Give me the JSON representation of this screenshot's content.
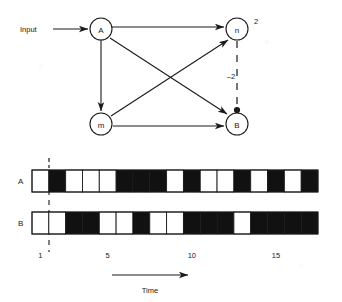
{
  "figure": {
    "background": "#ffffff",
    "ink": "#1a1a1a",
    "fill_black": "#111111"
  },
  "network": {
    "input_label": "Input",
    "nodes": [
      {
        "id": "A",
        "label": "A",
        "cx": 101,
        "cy": 29,
        "r": 11
      },
      {
        "id": "n",
        "label": "n",
        "cx": 237,
        "cy": 29,
        "r": 11
      },
      {
        "id": "m",
        "label": "m",
        "cx": 101,
        "cy": 124,
        "r": 11
      },
      {
        "id": "B",
        "label": "B",
        "cx": 237,
        "cy": 124,
        "r": 11
      }
    ],
    "edges": [
      {
        "from": "A",
        "to": "n",
        "style": "solid",
        "weight": ""
      },
      {
        "from": "A",
        "to": "m",
        "style": "solid",
        "weight": ""
      },
      {
        "from": "A",
        "to": "B",
        "style": "solid",
        "weight": ""
      },
      {
        "from": "m",
        "to": "n",
        "style": "solid",
        "weight": ""
      },
      {
        "from": "m",
        "to": "B",
        "style": "solid",
        "weight": ""
      },
      {
        "from": "n",
        "to": "B",
        "style": "dashed",
        "weight": "-2"
      }
    ],
    "node_weight_label": "2",
    "inhibitory_label": "–2"
  },
  "chart_data": {
    "type": "bar",
    "title": "",
    "xlabel": "Time",
    "ylabel": "",
    "grid": false,
    "legend": "none",
    "x": [
      1,
      2,
      3,
      4,
      5,
      6,
      7,
      8,
      9,
      10,
      11,
      12,
      13,
      14,
      15,
      16,
      17
    ],
    "xlim": [
      0,
      17
    ],
    "tick_labels": [
      "1",
      "5",
      "10",
      "15"
    ],
    "tick_values": [
      1,
      5,
      10,
      15
    ],
    "marker_label": "",
    "series": [
      {
        "name": "A",
        "values": [
          0,
          1,
          0,
          0,
          0,
          1,
          1,
          1,
          0,
          1,
          0,
          0,
          1,
          0,
          1,
          0,
          1
        ]
      },
      {
        "name": "B",
        "values": [
          0,
          0,
          1,
          1,
          0,
          0,
          1,
          0,
          0,
          1,
          1,
          1,
          0,
          1,
          1,
          1,
          1
        ]
      }
    ],
    "encoding": "1 = filled (black) cell, 0 = empty (white) cell",
    "onset_marker_time": 1
  },
  "axis": {
    "time_label": "Time"
  }
}
